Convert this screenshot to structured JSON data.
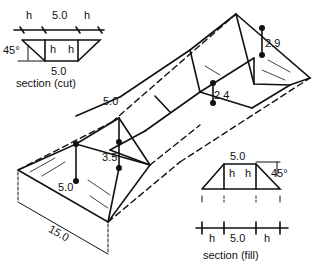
{
  "diagram": {
    "section_cut": {
      "caption": "section (cut)",
      "top_dims": [
        "h",
        "5.0",
        "h"
      ],
      "inner_labels": [
        "h",
        "h"
      ],
      "bottom_width": "5.0",
      "angle": "45°"
    },
    "section_fill": {
      "caption": "section (fill)",
      "top_width": "5.0",
      "inner_labels": [
        "h",
        "h"
      ],
      "angle": "45°",
      "bottom_dims": [
        "h",
        "5.0",
        "h"
      ]
    },
    "isometric": {
      "road_width": "5.0",
      "cut_depth_1": "2.9",
      "cut_depth_2": "2.4",
      "fill_height_1": "3.5",
      "fill_height_2": "5.0",
      "length": "15.0"
    },
    "colors": {
      "line": "#111111",
      "background": "#ffffff"
    }
  }
}
